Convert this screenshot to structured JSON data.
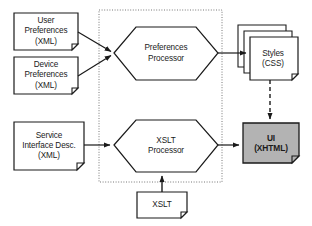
{
  "diagram": {
    "type": "flow-diagram",
    "title": "",
    "background_color": "#ffffff",
    "line_color": "#1a1a1a",
    "fill_default": "#ffffff",
    "ui_fill_color": "#b3b3b3",
    "group_border_style": "dotted",
    "nodes": [
      {
        "id": "user-preferences",
        "shape": "document",
        "lines": [
          "User",
          "Preferences",
          "(XML)"
        ]
      },
      {
        "id": "device-preferences",
        "shape": "document",
        "lines": [
          "Device",
          "Preferences",
          "(XML)"
        ]
      },
      {
        "id": "service-interface-desc",
        "shape": "document",
        "lines": [
          "Service",
          "Interface Desc.",
          "(XML)"
        ]
      },
      {
        "id": "preferences-processor",
        "shape": "hexagon",
        "lines": [
          "Preferences",
          "Processor"
        ]
      },
      {
        "id": "xslt-processor",
        "shape": "hexagon",
        "lines": [
          "XSLT",
          "Processor"
        ]
      },
      {
        "id": "styles-css",
        "shape": "document-stack",
        "lines": [
          "Styles",
          "(CSS)"
        ]
      },
      {
        "id": "ui-xhtml",
        "shape": "document",
        "fill": "#b3b3b3",
        "bold": true,
        "lines": [
          "UI",
          "(XHTML)"
        ]
      },
      {
        "id": "xslt",
        "shape": "document",
        "lines": [
          "XSLT"
        ]
      }
    ],
    "edges": [
      {
        "from": "user-preferences",
        "to": "preferences-processor",
        "style": "solid",
        "arrow": true
      },
      {
        "from": "device-preferences",
        "to": "preferences-processor",
        "style": "solid",
        "arrow": true
      },
      {
        "from": "service-interface-desc",
        "to": "xslt-processor",
        "style": "solid",
        "arrow": true
      },
      {
        "from": "preferences-processor",
        "to": "styles-css",
        "style": "solid",
        "arrow": true
      },
      {
        "from": "xslt-processor",
        "to": "ui-xhtml",
        "style": "solid",
        "arrow": true
      },
      {
        "from": "styles-css",
        "to": "ui-xhtml",
        "style": "dashed",
        "arrow": true
      },
      {
        "from": "xslt",
        "to": "xslt-processor",
        "style": "solid",
        "arrow": true
      }
    ]
  }
}
